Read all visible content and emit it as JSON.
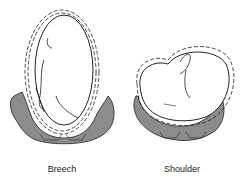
{
  "figure": {
    "panels": [
      {
        "label": "Breech"
      },
      {
        "label": "Shoulder"
      }
    ],
    "colors": {
      "pelvis": "#8c8c8c",
      "outline": "#222222",
      "background": "#ffffff"
    }
  }
}
